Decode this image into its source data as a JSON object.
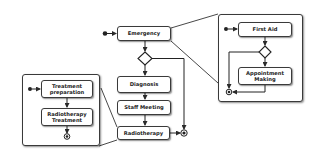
{
  "diagram": {
    "type": "uml-activity-diagram",
    "main_flow": {
      "nodes": [
        {
          "id": "emergency",
          "label": "Emergency"
        },
        {
          "id": "diagnosis",
          "label": "Diagnosis"
        },
        {
          "id": "staff_meeting",
          "label": "Staff Meeting"
        },
        {
          "id": "radiotherapy",
          "label": "Radiotherapy"
        }
      ]
    },
    "emergency_detail": {
      "nodes": [
        {
          "id": "first_aid",
          "label": "First Aid"
        },
        {
          "id": "appointment_making",
          "label_line1": "Appointment",
          "label_line2": "Making"
        }
      ]
    },
    "radiotherapy_detail": {
      "nodes": [
        {
          "id": "treatment_preparation",
          "label_line1": "Treatment",
          "label_line2": "preparation"
        },
        {
          "id": "radiotherapy_treatment",
          "label_line1": "Radiotherapy",
          "label_line2": "Treatment"
        }
      ]
    },
    "colors": {
      "stroke": "#3a3a3a",
      "fill": "#ffffff",
      "text": "#222222"
    }
  }
}
